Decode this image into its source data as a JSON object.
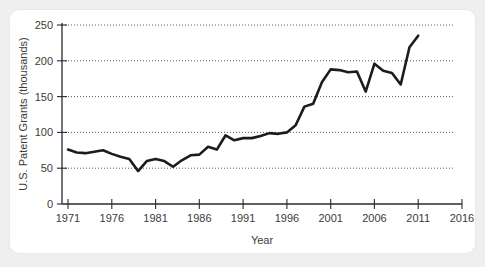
{
  "figure": {
    "card_background": "#ffffff",
    "page_background": "#efefef",
    "line_color": "#1c1c1c",
    "grid_color": "#4a4a4a",
    "axis_color": "#2b2b2b"
  },
  "chart_data": {
    "type": "line",
    "title": "",
    "subtitle": "",
    "xlabel": "Year",
    "ylabel": "U.S. Patent Grants (thousands)",
    "xlim": [
      1971,
      2016
    ],
    "ylim": [
      0,
      250
    ],
    "grid": true,
    "grid_axis": "y",
    "legend": false,
    "legend_position": "none",
    "xticks": [
      1971,
      1976,
      1981,
      1986,
      1991,
      1996,
      2001,
      2006,
      2011,
      2016
    ],
    "xtick_labels": [
      "1971",
      "1976",
      "1981",
      "1986",
      "1991",
      "1996",
      "2001",
      "2006",
      "2011",
      "2016"
    ],
    "yticks": [
      0,
      50,
      100,
      150,
      200,
      250
    ],
    "ytick_labels": [
      "0",
      "50",
      "100",
      "150",
      "200",
      "250"
    ],
    "series": [
      {
        "name": "U.S. Patent Grants",
        "x": [
          1971,
          1972,
          1973,
          1974,
          1975,
          1976,
          1977,
          1978,
          1979,
          1980,
          1981,
          1982,
          1983,
          1984,
          1985,
          1986,
          1987,
          1988,
          1989,
          1990,
          1991,
          1992,
          1993,
          1994,
          1995,
          1996,
          1997,
          1998,
          1999,
          2000,
          2001,
          2002,
          2003,
          2004,
          2005,
          2006,
          2007,
          2008,
          2009,
          2010,
          2011
        ],
        "values": [
          76,
          72,
          71,
          73,
          75,
          70,
          66,
          63,
          46,
          60,
          63,
          60,
          52,
          61,
          68,
          69,
          80,
          76,
          96,
          89,
          92,
          92,
          95,
          99,
          98,
          100,
          110,
          136,
          140,
          170,
          188,
          187,
          184,
          185,
          157,
          196,
          186,
          183,
          167,
          219,
          235
        ]
      }
    ]
  }
}
